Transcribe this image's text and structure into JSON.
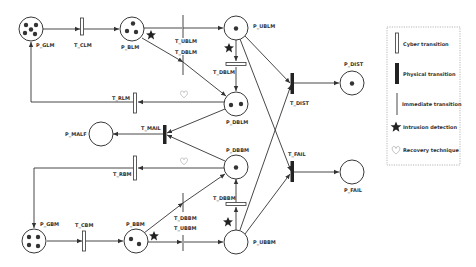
{
  "diagram": {
    "type": "petri-net",
    "places": [
      {
        "id": "P_GLM",
        "label": "P_GLM",
        "tokens": 5
      },
      {
        "id": "P_BLM",
        "label": "P_BLM",
        "tokens": 3
      },
      {
        "id": "P_UBLM",
        "label": "P_UBLM",
        "tokens": 1
      },
      {
        "id": "P_DBLM",
        "label": "P_DBLM",
        "tokens": 2
      },
      {
        "id": "P_DIST",
        "label": "P_DIST",
        "tokens": 1
      },
      {
        "id": "P_MALF",
        "label": "P_MALF",
        "tokens": 0
      },
      {
        "id": "P_DBBM",
        "label": "P_DBBM",
        "tokens": 1
      },
      {
        "id": "P_FAIL",
        "label": "P_FAIL",
        "tokens": 0
      },
      {
        "id": "P_GBM",
        "label": "P_GBM",
        "tokens": 4
      },
      {
        "id": "P_BBM",
        "label": "P_BBM",
        "tokens": 2
      },
      {
        "id": "P_UBBM",
        "label": "P_UBBM",
        "tokens": 0
      }
    ],
    "transitions": [
      {
        "id": "T_CLM",
        "label": "T_CLM",
        "kind": "cyber"
      },
      {
        "id": "T_UBLM",
        "label": "T_UBLM",
        "kind": "immediate"
      },
      {
        "id": "T_DBLM_imm",
        "label": "T_DBLM",
        "kind": "immediate"
      },
      {
        "id": "T_DBLM",
        "label": "T_DBLM",
        "kind": "cyber"
      },
      {
        "id": "T_RLM",
        "label": "T_RLM",
        "kind": "cyber"
      },
      {
        "id": "T_DIST",
        "label": "T_DIST",
        "kind": "physical"
      },
      {
        "id": "T_MAIL",
        "label": "T_MAIL",
        "kind": "physical"
      },
      {
        "id": "T_RBM",
        "label": "T_RBM",
        "kind": "cyber"
      },
      {
        "id": "T_FAIL",
        "label": "T_FAIL",
        "kind": "physical"
      },
      {
        "id": "T_CBM",
        "label": "T_CBM",
        "kind": "cyber"
      },
      {
        "id": "T_DBBM_imm",
        "label": "T_DBBM",
        "kind": "immediate"
      },
      {
        "id": "T_UBBM",
        "label": "T_UBBM",
        "kind": "immediate"
      },
      {
        "id": "T_DBBM",
        "label": "T_DBBM",
        "kind": "cyber"
      }
    ],
    "arcs": [
      [
        "P_GLM",
        "T_CLM"
      ],
      [
        "T_CLM",
        "P_BLM"
      ],
      [
        "P_BLM",
        "T_UBLM"
      ],
      [
        "T_UBLM",
        "P_UBLM"
      ],
      [
        "P_BLM",
        "T_DBLM_imm"
      ],
      [
        "T_DBLM_imm",
        "P_DBLM"
      ],
      [
        "P_UBLM",
        "T_DBLM"
      ],
      [
        "T_DBLM",
        "P_DBLM"
      ],
      [
        "P_DBLM",
        "T_RLM"
      ],
      [
        "T_RLM",
        "P_GLM"
      ],
      [
        "P_UBLM",
        "T_DIST"
      ],
      [
        "P_UBLM",
        "T_FAIL"
      ],
      [
        "T_DIST",
        "P_DIST"
      ],
      [
        "P_DBLM",
        "T_MAIL"
      ],
      [
        "P_DBBM",
        "T_MAIL"
      ],
      [
        "T_MAIL",
        "P_MALF"
      ],
      [
        "P_DBBM",
        "T_RBM"
      ],
      [
        "T_RBM",
        "P_GBM"
      ],
      [
        "P_GBM",
        "T_CBM"
      ],
      [
        "T_CBM",
        "P_BBM"
      ],
      [
        "P_BBM",
        "T_DBBM_imm"
      ],
      [
        "T_DBBM_imm",
        "P_DBBM"
      ],
      [
        "P_BBM",
        "T_UBBM"
      ],
      [
        "T_UBBM",
        "P_UBBM"
      ],
      [
        "P_UBBM",
        "T_DBBM"
      ],
      [
        "T_DBBM",
        "P_DBBM"
      ],
      [
        "P_UBBM",
        "T_DIST"
      ],
      [
        "P_UBBM",
        "T_FAIL"
      ],
      [
        "T_FAIL",
        "P_FAIL"
      ]
    ],
    "markers": {
      "intrusion_detection": [
        "near P_BLM",
        "near P_UBLM",
        "near P_BBM",
        "near P_UBBM"
      ],
      "recovery_technique": [
        "on arc P_DBLM-T_RLM",
        "on arc P_DBBM-T_RBM"
      ]
    }
  },
  "legend": {
    "items": [
      {
        "symbol": "cyber",
        "label": "Cyber transition"
      },
      {
        "symbol": "physical",
        "label": "Physical transition"
      },
      {
        "symbol": "immediate",
        "label": "Immediate transition"
      },
      {
        "symbol": "star",
        "label": "Intrusion detection"
      },
      {
        "symbol": "heart",
        "label": "Recovery technique"
      }
    ]
  },
  "colors": {
    "stroke": "#333333",
    "token": "#333333",
    "background": "#ffffff",
    "legend_border": "#888888"
  }
}
